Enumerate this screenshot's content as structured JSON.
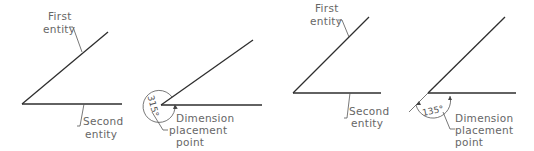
{
  "figure": {
    "panels": [
      {
        "id": "panel-1",
        "labels": {
          "first_entity": [
            "First",
            "entity"
          ],
          "second_entity": [
            "Second",
            "entity"
          ]
        }
      },
      {
        "id": "panel-2",
        "dimension_value": "315°",
        "labels": {
          "placement": [
            "Dimension",
            "placement",
            "point"
          ]
        }
      },
      {
        "id": "panel-3",
        "labels": {
          "first_entity": [
            "First",
            "entity"
          ],
          "second_entity": [
            "Second",
            "entity"
          ]
        }
      },
      {
        "id": "panel-4",
        "dimension_value": "135°",
        "labels": {
          "placement": [
            "Dimension",
            "placement",
            "point"
          ]
        }
      }
    ]
  }
}
